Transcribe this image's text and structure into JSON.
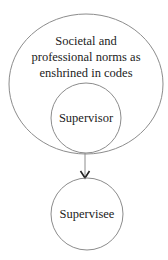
{
  "diagram": {
    "outer_circle": {
      "lines": [
        "Societal and",
        "professional norms as",
        "enshrined in codes"
      ]
    },
    "inner_circle": {
      "label": "Supervisor"
    },
    "bottom_circle": {
      "label": "Supervisee"
    },
    "arrow": {
      "from": "Supervisor",
      "to": "Supervisee",
      "direction": "down"
    },
    "colors": {
      "stroke": "#8c8c8c",
      "text": "#222222",
      "arrowhead": "#222222",
      "background": "#ffffff"
    }
  }
}
